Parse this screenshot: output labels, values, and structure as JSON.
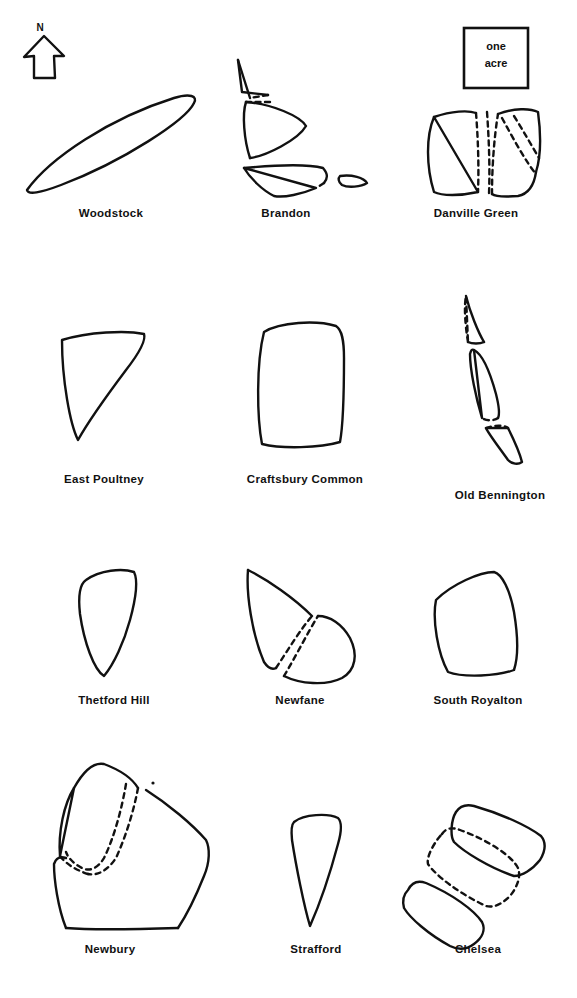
{
  "figure": {
    "title_visible": false,
    "north_arrow": {
      "letter": "N",
      "name": "north-arrow"
    },
    "scale_key": {
      "line1": "one",
      "line2": "acre"
    }
  },
  "rows": [
    {
      "row_index": 1,
      "cells": [
        {
          "label": "Woodstock",
          "shape": "elongated-lens",
          "pieces": 1,
          "dashed": false
        },
        {
          "label": "Brandon",
          "shape": "four-triangular-parcels",
          "pieces": 4,
          "dashed": true
        },
        {
          "label": "Danville Green",
          "shape": "split-quadrilaterals",
          "pieces": 3,
          "dashed": true
        }
      ]
    },
    {
      "row_index": 2,
      "cells": [
        {
          "label": "East Poultney",
          "shape": "right-triangle",
          "pieces": 1,
          "dashed": false
        },
        {
          "label": "Craftsbury Common",
          "shape": "rounded-rectangle",
          "pieces": 1,
          "dashed": false
        },
        {
          "label": "Old Bennington",
          "shape": "three-narrow-strips",
          "pieces": 3,
          "dashed": true
        }
      ]
    },
    {
      "row_index": 3,
      "cells": [
        {
          "label": "Thetford Hill",
          "shape": "curved-wedge",
          "pieces": 1,
          "dashed": false
        },
        {
          "label": "Newfane",
          "shape": "triangle-and-teardrop",
          "pieces": 2,
          "dashed": true
        },
        {
          "label": "South Royalton",
          "shape": "tilted-rounded-square",
          "pieces": 1,
          "dashed": false
        }
      ]
    },
    {
      "row_index": 4,
      "cells": [
        {
          "label": "Newbury",
          "shape": "overlapping-polygons",
          "pieces": 2,
          "dashed": true
        },
        {
          "label": "Strafford",
          "shape": "narrow-inverted-triangle",
          "pieces": 1,
          "dashed": false
        },
        {
          "label": "Chelsea",
          "shape": "three-stacked-bars",
          "pieces": 3,
          "dashed": true
        }
      ]
    }
  ],
  "colors": {
    "ink": "#111111",
    "background": "#ffffff"
  }
}
